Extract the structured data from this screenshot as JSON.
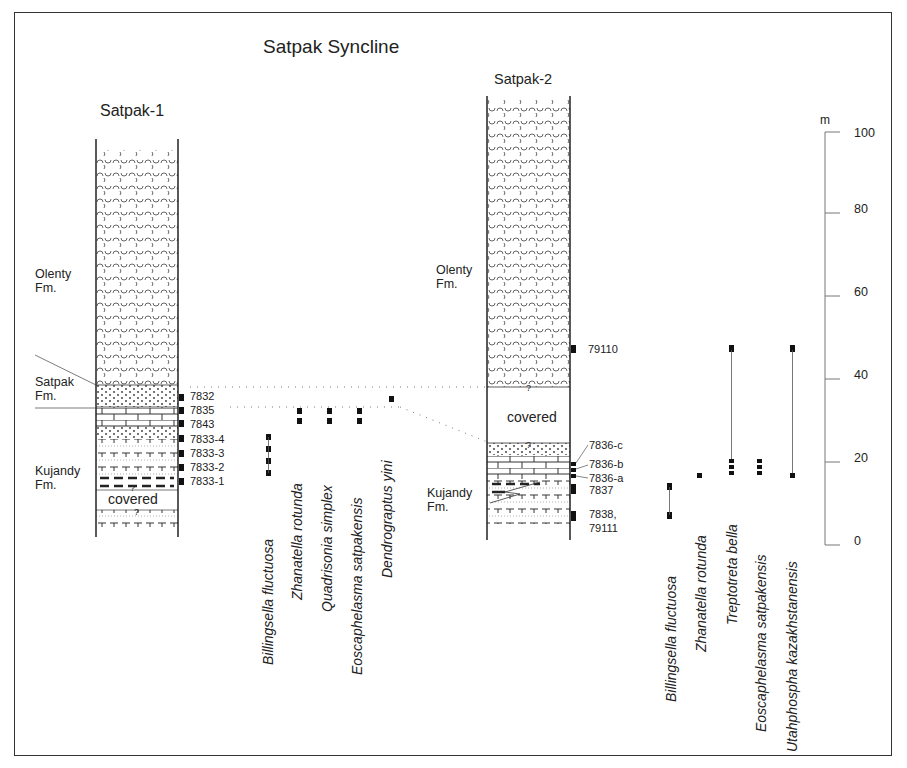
{
  "title": "Satpak Syncline",
  "sections": [
    {
      "name": "Satpak-1",
      "formations": [
        {
          "label_line1": "Olenty",
          "label_line2": "Fm."
        },
        {
          "label_line1": "Satpak",
          "label_line2": "Fm."
        },
        {
          "label_line1": "Kujandy",
          "label_line2": "Fm."
        }
      ],
      "covered_label": "covered",
      "samples": [
        "7832",
        "7835",
        "7843",
        "7833-4",
        "7833-3",
        "7833-2",
        "7833-1"
      ],
      "species": [
        "Billingsella fluctuosa",
        "Zhanatella rotunda",
        "Quadrisonia simplex",
        "Eoscaphelasma satpakensis",
        "Dendrograptus yini"
      ]
    },
    {
      "name": "Satpak-2",
      "formations": [
        {
          "label_line1": "Olenty",
          "label_line2": "Fm."
        },
        {
          "label_line1": "Kujandy",
          "label_line2": "Fm."
        }
      ],
      "covered_label": "covered",
      "samples": [
        "79110",
        "7836-c",
        "7836-b",
        "7836-a",
        "7837",
        "7838,",
        "79111"
      ],
      "species": [
        "Billingsella fluctuosa",
        "Zhanatella rotunda",
        "Treptotreta bella",
        "Eoscaphelasma satpakensis",
        "Utahphospha kazakhstanensis"
      ]
    }
  ],
  "scale": {
    "unit": "m",
    "ticks": [
      "100",
      "80",
      "60",
      "40",
      "20",
      "0"
    ]
  },
  "uncertain_mark": "?"
}
